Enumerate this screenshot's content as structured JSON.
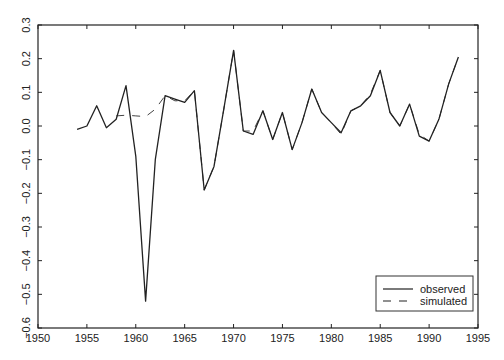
{
  "chart_data": {
    "type": "line",
    "title": "",
    "xlabel": "",
    "ylabel": "",
    "xlim": [
      1950,
      1995
    ],
    "ylim": [
      -0.6,
      0.3
    ],
    "x_ticks": [
      1950,
      1955,
      1960,
      1965,
      1970,
      1975,
      1980,
      1985,
      1990,
      1995
    ],
    "y_ticks": [
      -0.6,
      -0.5,
      -0.4,
      -0.3,
      -0.2,
      -0.1,
      0.0,
      0.1,
      0.2,
      0.3
    ],
    "y_tick_labels": [
      "−0.6",
      "−0.5",
      "−0.4",
      "−0.3",
      "−0.2",
      "−0.1",
      "0.0",
      "0.1",
      "0.2",
      "0.3"
    ],
    "grid": false,
    "legend_position": "lower right",
    "series": [
      {
        "name": "observed",
        "style": "solid",
        "x": [
          1954,
          1955,
          1956,
          1957,
          1958,
          1959,
          1960,
          1961,
          1962,
          1963,
          1964,
          1965,
          1966,
          1967,
          1968,
          1969,
          1970,
          1971,
          1972,
          1973,
          1974,
          1975,
          1976,
          1977,
          1978,
          1979,
          1980,
          1981,
          1982,
          1983,
          1984,
          1985,
          1986,
          1987,
          1988,
          1989,
          1990,
          1991,
          1992,
          1993
        ],
        "values": [
          -0.01,
          0.0,
          0.06,
          -0.005,
          0.02,
          0.12,
          -0.09,
          -0.52,
          -0.1,
          0.09,
          0.08,
          0.07,
          0.105,
          -0.19,
          -0.12,
          0.05,
          0.225,
          -0.015,
          -0.025,
          0.045,
          -0.04,
          0.04,
          -0.07,
          0.01,
          0.11,
          0.04,
          0.01,
          -0.02,
          0.045,
          0.06,
          0.09,
          0.165,
          0.04,
          0.0,
          0.065,
          -0.03,
          -0.045,
          0.02,
          0.125,
          0.205
        ]
      },
      {
        "name": "simulated",
        "style": "dashed",
        "x": [
          1958,
          1959,
          1960,
          1961,
          1962,
          1963,
          1964,
          1965,
          1966,
          1967,
          1968,
          1969,
          1970,
          1971,
          1972,
          1973,
          1974,
          1975,
          1976,
          1977,
          1978,
          1979,
          1980,
          1981,
          1982,
          1983,
          1984,
          1985,
          1986,
          1987,
          1988,
          1989,
          1990,
          1991,
          1992,
          1993
        ],
        "values": [
          0.03,
          0.032,
          0.03,
          0.028,
          0.05,
          0.09,
          0.075,
          0.075,
          0.105,
          -0.19,
          -0.12,
          0.05,
          0.225,
          -0.015,
          -0.015,
          0.045,
          -0.04,
          0.04,
          -0.07,
          0.01,
          0.11,
          0.04,
          0.01,
          -0.025,
          0.045,
          0.06,
          0.095,
          0.165,
          0.04,
          0.0,
          0.065,
          -0.025,
          -0.045,
          0.02,
          0.125,
          0.205
        ]
      }
    ]
  },
  "legend": {
    "items": [
      {
        "label": "observed"
      },
      {
        "label": "simulated"
      }
    ]
  }
}
